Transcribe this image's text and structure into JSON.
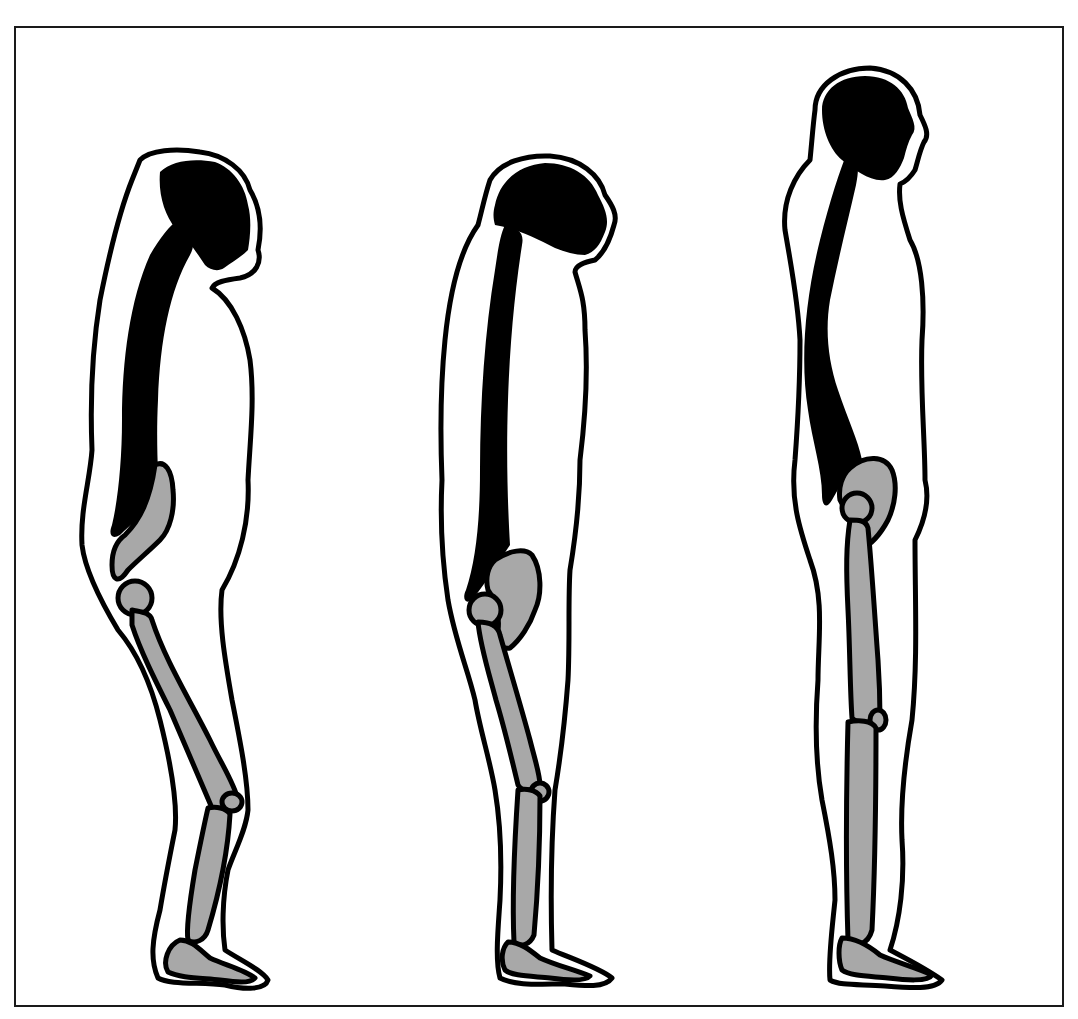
{
  "diagram": {
    "title": "",
    "figures": [
      {
        "id": "stooped",
        "posture": "stooped",
        "label": ""
      },
      {
        "id": "semi-upright",
        "posture": "semi-upright",
        "label": ""
      },
      {
        "id": "upright",
        "posture": "upright",
        "label": ""
      }
    ],
    "colors": {
      "background": "#ffffff",
      "outline": "#000000",
      "bone": "#a8a8a8",
      "spine_head": "#000000",
      "frame": "#1a1a1a"
    }
  }
}
